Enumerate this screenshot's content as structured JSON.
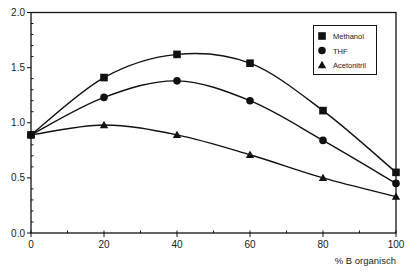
{
  "chart_data": {
    "type": "line",
    "title": "",
    "xlabel": "% B organisch",
    "ylabel": "",
    "x": [
      0,
      20,
      40,
      60,
      80,
      100
    ],
    "xlim": [
      0,
      100
    ],
    "ylim": [
      0.0,
      2.0
    ],
    "x_ticks": [
      "0",
      "20",
      "40",
      "60",
      "80",
      "100"
    ],
    "y_ticks": [
      "0.0",
      "0.5",
      "1.0",
      "1.5",
      "2.0"
    ],
    "grid": false,
    "legend_position": "upper right (inside)",
    "series": [
      {
        "name": "Methanol",
        "marker": "square",
        "values": [
          0.89,
          1.41,
          1.62,
          1.54,
          1.11,
          0.55
        ]
      },
      {
        "name": "THF",
        "marker": "circle",
        "values": [
          0.89,
          1.23,
          1.38,
          1.2,
          0.84,
          0.45
        ]
      },
      {
        "name": "Acetonitril",
        "marker": "triangle",
        "values": [
          0.89,
          0.98,
          0.89,
          0.71,
          0.5,
          0.33
        ]
      }
    ]
  },
  "colors": {
    "ink": "#111111",
    "background": "#ffffff"
  }
}
